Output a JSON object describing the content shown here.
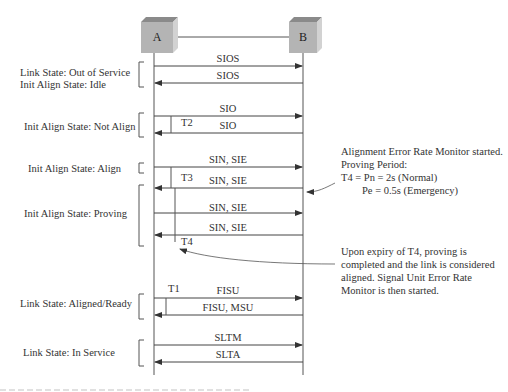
{
  "nodes": [
    {
      "id": "A",
      "label": "A"
    },
    {
      "id": "B",
      "label": "B"
    }
  ],
  "state_labels": [
    {
      "lines": [
        "Link State: Out of Service",
        "Init Align State: Idle"
      ]
    },
    {
      "lines": [
        "Init Align State: Not Align"
      ]
    },
    {
      "lines": [
        "Init Align State: Align"
      ]
    },
    {
      "lines": [
        "Init Align State: Proving"
      ]
    },
    {
      "lines": [
        "Link  State: Aligned/Ready"
      ]
    },
    {
      "lines": [
        "Link State:  In Service"
      ]
    }
  ],
  "messages": [
    {
      "label": "SIOS",
      "dir": "A->B"
    },
    {
      "label": "SIOS",
      "dir": "B->A"
    },
    {
      "label": "SIO",
      "dir": "A->B"
    },
    {
      "label": "SIO",
      "dir": "B->A"
    },
    {
      "label": "SIN, SIE",
      "dir": "A->B"
    },
    {
      "label": "SIN, SIE",
      "dir": "B->A"
    },
    {
      "label": "SIN, SIE",
      "dir": "A->B"
    },
    {
      "label": "SIN, SIE",
      "dir": "B->A"
    },
    {
      "label": "FISU",
      "dir": "A->B"
    },
    {
      "label": "FISU, MSU",
      "dir": "B->A"
    },
    {
      "label": "SLTM",
      "dir": "A->B"
    },
    {
      "label": "SLTA",
      "dir": "B->A"
    }
  ],
  "timers": [
    {
      "label": "T2"
    },
    {
      "label": "T3"
    },
    {
      "label": "T4"
    },
    {
      "label": "T1"
    }
  ],
  "notes": {
    "proving": [
      "Alignment Error Rate Monitor started.",
      "Proving Period:",
      "T4  = Pn = 2s   (Normal)",
      "Pe = 0.5s (Emergency)"
    ],
    "expiry": [
      "Upon expiry of T4, proving is",
      "completed and the link is considered",
      "aligned. Signal Unit Error Rate",
      "Monitor is then started."
    ]
  },
  "colors": {
    "node_front": "#b4b4b4",
    "node_top": "#8a8a8a",
    "node_side": "#d2d2d2",
    "line": "#555555"
  }
}
